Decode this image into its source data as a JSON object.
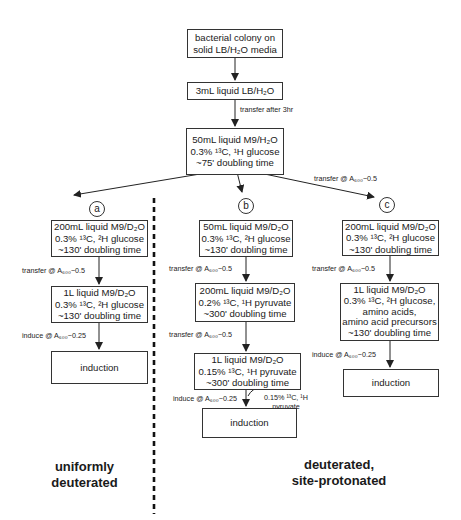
{
  "diagram": {
    "start": {
      "box0": [
        "bacterial colony on",
        "solid LB/H₂O media"
      ],
      "box1": [
        "3mL liquid LB/H₂O"
      ],
      "transfer_label": "transfer after 3hr",
      "box2": [
        "50mL liquid M9/H₂O",
        "0.3% ¹³C, ¹H glucose",
        "~75' doubling time"
      ],
      "branch_c_label": "transfer @ A₆₀₀~0.5"
    },
    "branches": {
      "a": {
        "marker": "a",
        "box1": [
          "200mL liquid M9/D₂O",
          "0.3% ¹³C, ²H glucose",
          "~130' doubling time"
        ],
        "label1": "transfer @ A₆₀₀~0.5",
        "box2": [
          "1L liquid M9/D₂O",
          "0.3% ¹³C, ²H glucose",
          "~130' doubling time"
        ],
        "label2": "induce @ A₆₀₀~0.25",
        "final": "induction"
      },
      "b": {
        "marker": "b",
        "box1": [
          "50mL liquid M9/D₂O",
          "0.3% ¹³C, ²H glucose",
          "~130' doubling time"
        ],
        "label1": "transfer @ A₆₀₀~0.5",
        "box2": [
          "200mL liquid M9/D₂O",
          "0.2% ¹³C, ¹H pyruvate",
          "~300' doubling time"
        ],
        "label2": "transfer @ A₆₀₀~0.5",
        "box3": [
          "1L liquid M9/D₂O",
          "0.15% ¹³C, ¹H pyruvate",
          "~300' doubling time"
        ],
        "label3": "induce @ A₆₀₀~0.25",
        "side_add": [
          "0.15% ¹³C, ¹H",
          "pyruvate"
        ],
        "final": "induction"
      },
      "c": {
        "marker": "c",
        "box1": [
          "200mL liquid M9/D₂O",
          "0.3% ¹³C, ²H glucose",
          "~130' doubling time"
        ],
        "label1": "transfer @ A₆₀₀~0.5",
        "box2": [
          "1L liquid M9/D₂O",
          "0.3% ¹³C, ²H glucose,",
          "amino acids,",
          "amino acid precursors",
          "~130' doubling time"
        ],
        "label2": "induce @ A₆₀₀~0.25",
        "final": "induction"
      }
    },
    "footer": {
      "left": [
        "uniformly",
        "deuterated"
      ],
      "right": [
        "deuterated,",
        "site-protonated"
      ]
    }
  }
}
